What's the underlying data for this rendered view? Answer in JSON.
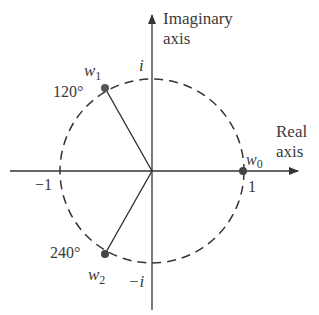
{
  "diagram": {
    "type": "complex-plane-roots-of-unity",
    "axes": {
      "imaginary_label_line1": "Imaginary",
      "imaginary_label_line2": "axis",
      "real_label_line1": "Real",
      "real_label_line2": "axis"
    },
    "tick_labels": {
      "pos_one": "1",
      "neg_one": "−1",
      "pos_i": "i",
      "neg_i": "−i"
    },
    "points": [
      {
        "name": "w",
        "sub": "0",
        "angle_label": "",
        "angle_deg": 0
      },
      {
        "name": "w",
        "sub": "1",
        "angle_label": "120°",
        "angle_deg": 120
      },
      {
        "name": "w",
        "sub": "2",
        "angle_label": "240°",
        "angle_deg": 240
      }
    ],
    "circle": {
      "style": "dashed",
      "radius": 1
    },
    "colors": {
      "ink": "#3a3a3a",
      "point": "#444444"
    }
  }
}
